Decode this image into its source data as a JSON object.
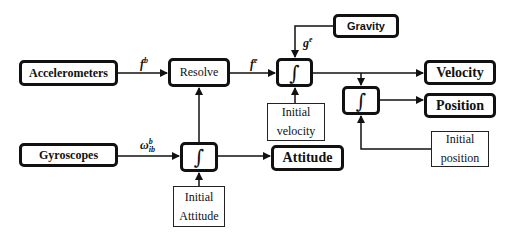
{
  "diagram": {
    "type": "block-diagram",
    "title": "",
    "nodes": {
      "accelerometers": "Accelerometers",
      "resolve": "Resolve",
      "gravity": "Gravity",
      "integrator_velocity": "∫",
      "integrator_position": "∫",
      "integrator_attitude": "∫",
      "velocity": "Velocity",
      "position": "Position",
      "attitude": "Attitude",
      "gyroscopes": "Gyroscopes",
      "initial_velocity": {
        "line1": "Initial",
        "line2": "velocity"
      },
      "initial_position": {
        "line1": "Initial",
        "line2": "position"
      },
      "initial_attitude": {
        "line1": "Initial",
        "line2": "Attitude"
      }
    },
    "edge_labels": {
      "f_b": {
        "base": "f",
        "sup": "b"
      },
      "f_e": {
        "base": "f",
        "sup": "e"
      },
      "g_e": {
        "base": "g",
        "sup": "e"
      },
      "omega_ib_b": {
        "base": "ω",
        "sup": "b",
        "sub": "ib"
      }
    },
    "edges": [
      {
        "from": "accelerometers",
        "to": "resolve",
        "label": "f_b"
      },
      {
        "from": "resolve",
        "to": "integrator_velocity",
        "label": "f_e"
      },
      {
        "from": "gravity",
        "to": "integrator_velocity",
        "label": "g_e"
      },
      {
        "from": "initial_velocity",
        "to": "integrator_velocity"
      },
      {
        "from": "integrator_velocity",
        "to": "velocity"
      },
      {
        "from": "integrator_velocity",
        "to": "integrator_position"
      },
      {
        "from": "integrator_position",
        "to": "position"
      },
      {
        "from": "initial_position",
        "to": "integrator_position"
      },
      {
        "from": "gyroscopes",
        "to": "integrator_attitude",
        "label": "omega_ib_b"
      },
      {
        "from": "initial_attitude",
        "to": "integrator_attitude"
      },
      {
        "from": "integrator_attitude",
        "to": "attitude"
      },
      {
        "from": "integrator_attitude",
        "to": "resolve"
      }
    ],
    "colors": {
      "stroke": "#111111",
      "background": "#ffffff"
    }
  }
}
